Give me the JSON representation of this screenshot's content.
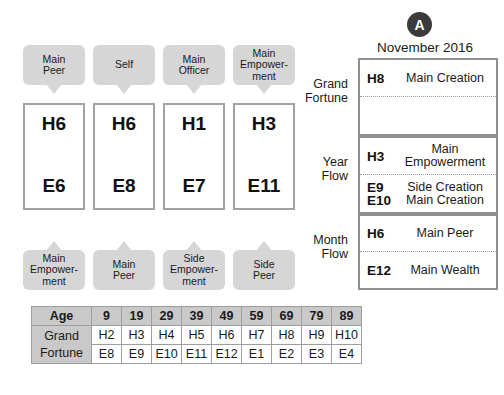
{
  "badge": {
    "label": "A",
    "color": "#3b3b3b"
  },
  "month_title": "November 2016",
  "pillars": {
    "columns": [
      {
        "top_label": "Main\nPeer",
        "top_line1": "Main",
        "top_line2": "Peer",
        "heaven": "H6",
        "earth": "E6",
        "bottom_line1": "Main",
        "bottom_line2": "Empower-",
        "bottom_line3": "ment"
      },
      {
        "top_label": "Self",
        "top_line1": "Self",
        "top_line2": "",
        "heaven": "H6",
        "earth": "E8",
        "bottom_line1": "Main",
        "bottom_line2": "Peer",
        "bottom_line3": ""
      },
      {
        "top_label": "Main Officer",
        "top_line1": "Main",
        "top_line2": "Officer",
        "heaven": "H1",
        "earth": "E7",
        "bottom_line1": "Side",
        "bottom_line2": "Empower-",
        "bottom_line3": "ment"
      },
      {
        "top_label": "Main Empowerment",
        "top_line1": "Main",
        "top_line2": "Empower-",
        "top_line3": "ment",
        "heaven": "H3",
        "earth": "E11",
        "bottom_line1": "Side",
        "bottom_line2": "Peer",
        "bottom_line3": ""
      }
    ]
  },
  "flow": {
    "grand_fortune": {
      "label_line1": "Grand",
      "label_line2": "Fortune",
      "row1_stem": "H8",
      "row1_desc": "Main Creation",
      "row2_stem": "",
      "row2_desc": ""
    },
    "year_flow": {
      "label_line1": "Year",
      "label_line2": "Flow",
      "row1_stem": "H3",
      "row1_desc_line1": "Main",
      "row1_desc_line2": "Empowerment",
      "row2_stem_line1": "E9",
      "row2_stem_line2": "E10",
      "row2_desc_line1": "Side Creation",
      "row2_desc_line2": "Main Creation"
    },
    "month_flow": {
      "label_line1": "Month",
      "label_line2": "Flow",
      "row1_stem": "H6",
      "row1_desc": "Main Peer",
      "row2_stem": "E12",
      "row2_desc": "Main Wealth"
    }
  },
  "age_table": {
    "corner_label": "Age",
    "row_label_line1": "Grand",
    "row_label_line2": "Fortune",
    "ages": [
      "9",
      "19",
      "29",
      "39",
      "49",
      "59",
      "69",
      "79",
      "89"
    ],
    "heaven_row": [
      "H2",
      "H3",
      "H4",
      "H5",
      "H6",
      "H7",
      "H8",
      "H9",
      "H10"
    ],
    "earth_row": [
      "E8",
      "E9",
      "E10",
      "E11",
      "E12",
      "E1",
      "E2",
      "E3",
      "E4"
    ]
  }
}
